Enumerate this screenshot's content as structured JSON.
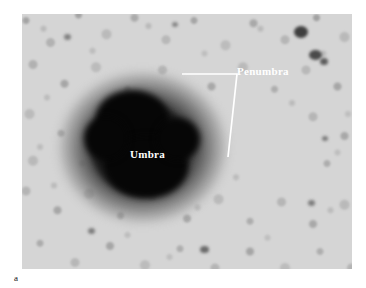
{
  "figure": {
    "caption_label": "a",
    "media_type": "grayscale-photograph"
  },
  "annotations": {
    "labels": [
      {
        "id": "penumbra",
        "text": "Penumbra",
        "color": "#ffffff",
        "x": 237,
        "y": 66
      },
      {
        "id": "umbra",
        "text": "Umbra",
        "color": "#ffffff",
        "x": 130,
        "y": 149
      }
    ],
    "leader_line": {
      "color": "#ffffff",
      "stroke_width": 1.7,
      "points": "182,74 237,74 228,157"
    }
  },
  "palette": {
    "photosphere": "#d2d2d2",
    "granulation_dark": "#8c8c8c",
    "penumbra": "#4a4a4a",
    "umbra": "#050505",
    "annotation": "#ffffff",
    "page_background": "#ffffff",
    "caption_text": "#111111"
  },
  "plate": {
    "x": 22,
    "y": 14,
    "width": 330,
    "height": 255
  }
}
